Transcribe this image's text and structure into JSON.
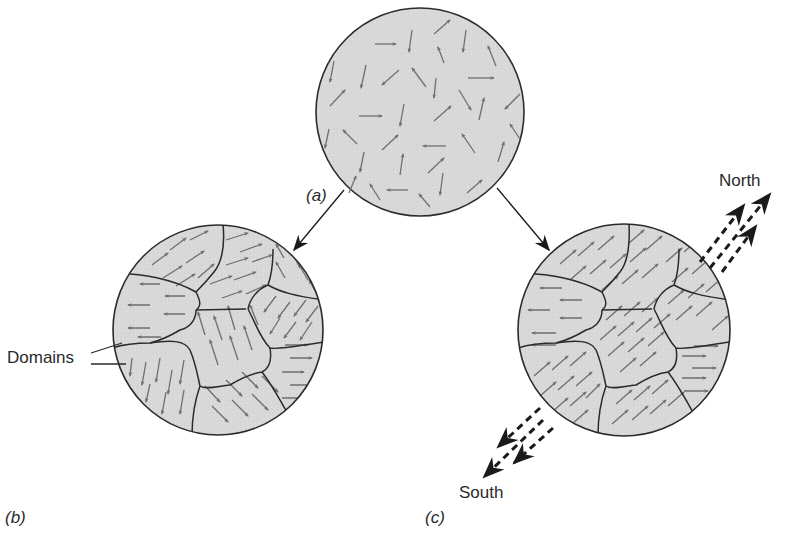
{
  "figure": {
    "panels": [
      {
        "id": "a",
        "label": "(a)",
        "content": "random-dipoles"
      },
      {
        "id": "b",
        "label": "(b)",
        "content": "unmagnetized-domains"
      },
      {
        "id": "c",
        "label": "(c)",
        "content": "magnetized-domains"
      }
    ],
    "annotations": {
      "domains": "Domains",
      "north": "North",
      "south": "South"
    },
    "colors": {
      "fill": "#d9d9d9",
      "outline": "#2b2b2b",
      "arrow": "#6e6e6e",
      "text": "#2a2a2a",
      "background": "#ffffff"
    },
    "icons": {
      "pole-arrow": "dashed-triple-arrow",
      "connector-arrow": "solid-arrow"
    }
  }
}
